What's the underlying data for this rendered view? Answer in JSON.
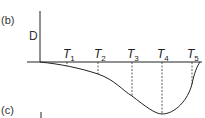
{
  "panel_b_label": "(b)",
  "panel_c_label": "(c)",
  "y_axis_label": "D",
  "ticks": [
    {
      "letter": "T",
      "sub": "1",
      "x": 67,
      "depth": 66
    },
    {
      "letter": "T",
      "sub": "2",
      "x": 98,
      "depth": 74
    },
    {
      "letter": "T",
      "sub": "3",
      "x": 132,
      "depth": 96
    },
    {
      "letter": "T",
      "sub": "4",
      "x": 162,
      "depth": 114
    },
    {
      "letter": "T",
      "sub": "5",
      "x": 192,
      "depth": 84
    }
  ],
  "colors": {
    "line": "#222222",
    "text": "#333333"
  }
}
